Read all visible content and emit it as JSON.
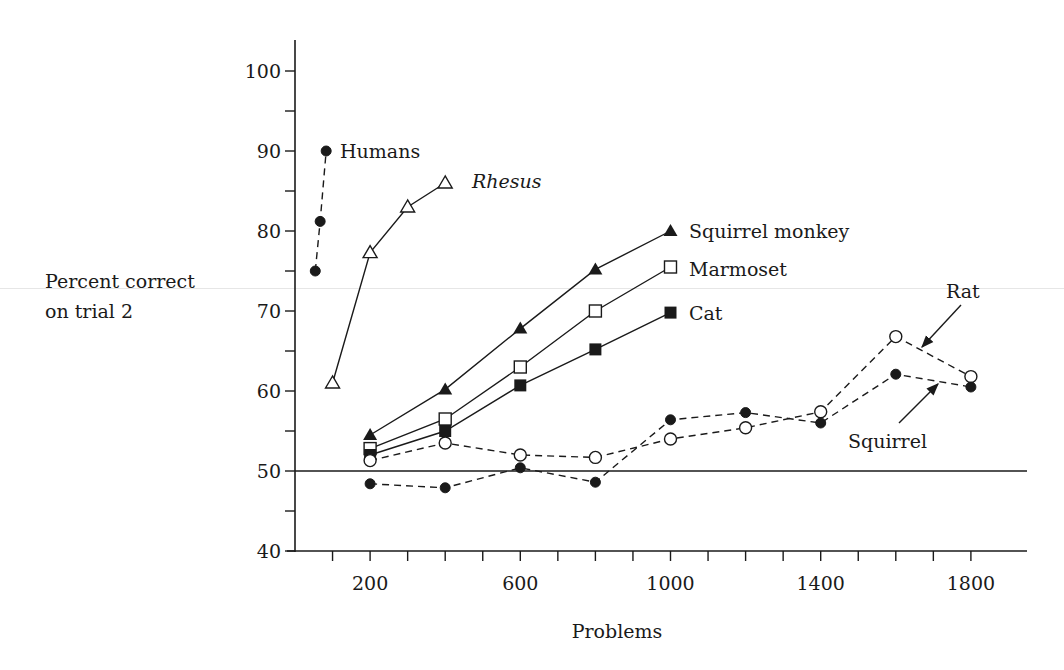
{
  "chart_data": {
    "type": "line",
    "title": "",
    "xlabel": "Problems",
    "ylabel": "Percent correct on trial 2",
    "ylabel_lines": [
      "Percent correct",
      "on trial 2"
    ],
    "xlim": [
      0,
      1950
    ],
    "ylim": [
      40,
      104
    ],
    "x_ticks_major": [
      200,
      600,
      1000,
      1400,
      1800
    ],
    "x_ticks_minor_step": 100,
    "y_ticks_major": [
      40,
      50,
      60,
      70,
      80,
      90,
      100
    ],
    "y_ticks_minor_step": 5,
    "reference_line": {
      "y": 50
    },
    "grid": false,
    "legend": "inline labels",
    "series": [
      {
        "name": "Humans",
        "marker": "filled-circle",
        "line": "dashed",
        "italic": false,
        "x": [
          54,
          67,
          83
        ],
        "values": [
          75,
          81.2,
          90
        ],
        "label_pos": [
          340,
          158
        ]
      },
      {
        "name": "Rhesus",
        "marker": "open-triangle",
        "line": "solid",
        "italic": true,
        "x": [
          100,
          200,
          300,
          400
        ],
        "values": [
          61,
          77.3,
          83,
          86
        ],
        "label_pos": [
          472,
          188
        ]
      },
      {
        "name": "Squirrel monkey",
        "marker": "filled-triangle",
        "line": "solid",
        "italic": false,
        "x": [
          200,
          400,
          600,
          800,
          1000
        ],
        "values": [
          54.5,
          60.2,
          67.8,
          75.2,
          80
        ],
        "label_pos": [
          689,
          238
        ]
      },
      {
        "name": "Marmoset",
        "marker": "open-square",
        "line": "solid",
        "italic": false,
        "x": [
          200,
          400,
          600,
          800,
          1000
        ],
        "values": [
          52.8,
          56.5,
          63,
          70,
          75.5
        ],
        "label_pos": [
          689,
          276
        ]
      },
      {
        "name": "Cat",
        "marker": "filled-square",
        "line": "solid",
        "italic": false,
        "x": [
          200,
          400,
          600,
          800,
          1000
        ],
        "values": [
          52,
          55,
          60.7,
          65.2,
          69.8
        ],
        "label_pos": [
          689,
          320
        ]
      },
      {
        "name": "Rat",
        "marker": "open-circle",
        "line": "dashed",
        "italic": false,
        "x": [
          200,
          400,
          600,
          800,
          1000,
          1200,
          1400,
          1600,
          1800
        ],
        "values": [
          51.3,
          53.5,
          52,
          51.7,
          54,
          55.4,
          57.4,
          66.8,
          61.8
        ],
        "label_pos": [
          946,
          298
        ],
        "arrow": [
          [
            961,
            305
          ],
          [
            922,
            347
          ]
        ]
      },
      {
        "name": "Squirrel",
        "marker": "filled-circle",
        "line": "dashed",
        "italic": false,
        "x": [
          200,
          400,
          600,
          800,
          1000,
          1200,
          1400,
          1600,
          1800
        ],
        "values": [
          48.4,
          47.9,
          50.4,
          48.6,
          56.4,
          57.3,
          56,
          62.1,
          60.5
        ],
        "label_pos": [
          848,
          448
        ],
        "arrow": [
          [
            899,
            423
          ],
          [
            938,
            384
          ]
        ]
      }
    ]
  }
}
